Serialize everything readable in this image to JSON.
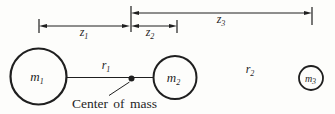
{
  "labels": {
    "z1": {
      "base": "z",
      "sub": "1"
    },
    "z2": {
      "base": "z",
      "sub": "2"
    },
    "z3": {
      "base": "z",
      "sub": "3"
    },
    "r1": {
      "base": "r",
      "sub": "1"
    },
    "r2": {
      "base": "r",
      "sub": "2"
    },
    "m1": {
      "base": "m",
      "sub": "1"
    },
    "m2": {
      "base": "m",
      "sub": "2"
    },
    "m3": {
      "base": "m",
      "sub": "3"
    },
    "center_of_mass": "Center of mass"
  },
  "colors": {
    "ink": "#1f1f1f",
    "background": "#fdfdfb",
    "r2_artifact_gradient": [
      "#3d3d3d",
      "#7fb07f",
      "#9a9a9a",
      "#c080c0",
      "#e0a0c8",
      "#8fbc8f",
      "#444444"
    ]
  }
}
